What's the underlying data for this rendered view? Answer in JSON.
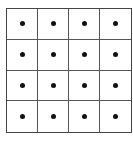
{
  "diagram": {
    "type": "grid",
    "rows": 4,
    "cols": 4,
    "cell_marker": "center-dot",
    "line_color": "#555555",
    "dot_color": "#111111"
  }
}
